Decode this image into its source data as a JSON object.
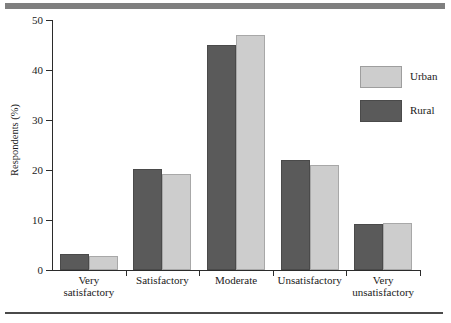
{
  "chart_data": {
    "type": "bar",
    "title": "",
    "xlabel": "",
    "ylabel": "Respondents (%)",
    "ylim": [
      0,
      50
    ],
    "yticks": [
      0,
      10,
      20,
      30,
      40,
      50
    ],
    "grid": false,
    "legend_position": "right",
    "categories": [
      "Very\nsatisfactory",
      "Satisfactory",
      "Moderate",
      "Unsatisfactory",
      "Very\nunsatisfactory"
    ],
    "series": [
      {
        "name": "Rural",
        "color": "#5a5a5a",
        "values": [
          3.2,
          20.2,
          45.0,
          22.0,
          9.2
        ]
      },
      {
        "name": "Urban",
        "color": "#cdcdcd",
        "values": [
          2.8,
          19.2,
          47.0,
          21.0,
          9.5
        ]
      }
    ]
  },
  "legend": {
    "entries": [
      {
        "label": "Urban",
        "swatch": "urban"
      },
      {
        "label": "Rural",
        "swatch": "rural"
      }
    ]
  },
  "axis": {
    "y_title": "Respondents (%)",
    "y_tick_labels": [
      "0",
      "10",
      "20",
      "30",
      "40",
      "50"
    ]
  }
}
